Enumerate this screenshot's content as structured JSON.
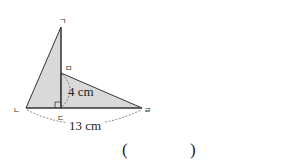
{
  "diagram": {
    "vertices": {
      "g": {
        "label": "ㄱ",
        "x": 61,
        "y": 27
      },
      "n": {
        "label": "ㄴ",
        "x": 26,
        "y": 108
      },
      "d": {
        "label": "ㄷ",
        "x": 61,
        "y": 108
      },
      "r": {
        "label": "ㄹ",
        "x": 142,
        "y": 108
      },
      "m": {
        "label": "ㅁ",
        "x": 61,
        "y": 73
      }
    },
    "measurements": {
      "height": "4 cm",
      "base": "13 cm"
    },
    "colors": {
      "fill": "#d9d9d9",
      "stroke": "#333333"
    }
  },
  "answer": {
    "open": "(",
    "close": ")"
  }
}
